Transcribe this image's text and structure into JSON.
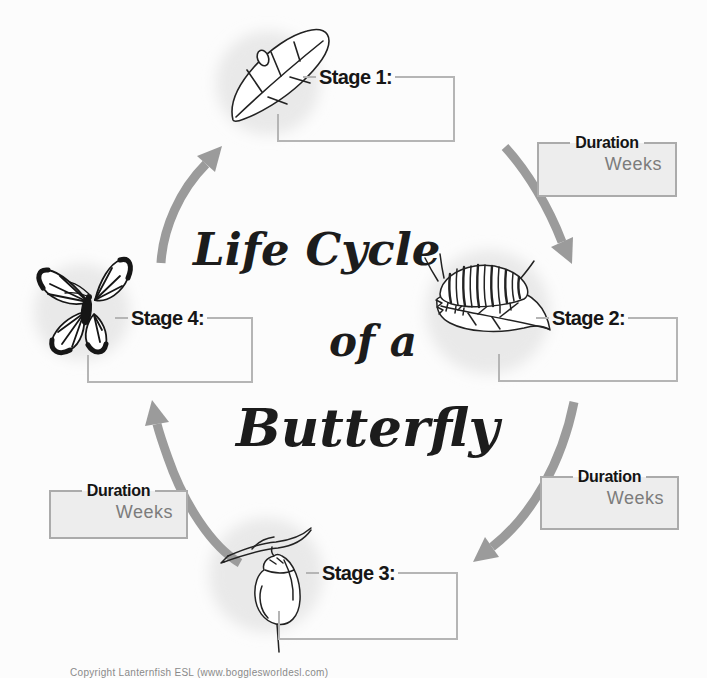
{
  "title": {
    "line1": "Life Cycle",
    "line2": "of a",
    "line3": "Butterfly"
  },
  "stages": [
    {
      "label": "Stage 1:",
      "illustration": "egg-on-leaf-icon",
      "answer_value": ""
    },
    {
      "label": "Stage 2:",
      "illustration": "caterpillar-on-leaf-icon",
      "answer_value": ""
    },
    {
      "label": "Stage 3:",
      "illustration": "chrysalis-on-branch-icon",
      "answer_value": ""
    },
    {
      "label": "Stage 4:",
      "illustration": "butterfly-icon",
      "answer_value": ""
    }
  ],
  "duration_boxes": [
    {
      "position": "top-right",
      "label": "Duration",
      "value": "Weeks"
    },
    {
      "position": "bottom-right",
      "label": "Duration",
      "value": "Weeks"
    },
    {
      "position": "left",
      "label": "Duration",
      "value": "Weeks"
    }
  ],
  "arrows": [
    "arrow-stage1-to-stage2",
    "arrow-stage2-to-stage3",
    "arrow-stage3-to-stage4",
    "arrow-stage4-to-stage1"
  ],
  "footer": {
    "copyright": "Copyright Lanternfish ESL (www.bogglesworldesl.com)"
  },
  "colors": {
    "background": "#fcfcfc",
    "arrow": "#9b9b9b",
    "stage_box_border": "#b5b5b5",
    "duration_fill": "#ededed",
    "duration_border": "#ababab",
    "weeks_text": "#7c7c7c",
    "ink": "#1c1c1c",
    "shadow_blob": "#e9e9e9"
  }
}
